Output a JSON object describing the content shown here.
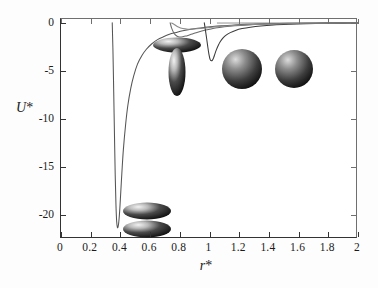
{
  "figure": {
    "background": "#ffffff",
    "frame_color": "#333333"
  },
  "axes": {
    "x": {
      "title": "r*",
      "title_main": "r",
      "title_star": "*",
      "min": 0,
      "max": 2,
      "ticks": [
        0,
        0.2,
        0.4,
        0.6,
        0.8,
        1,
        1.2,
        1.4,
        1.6,
        1.8,
        2
      ],
      "tick_labels": [
        "0",
        "0.2",
        "0.4",
        "0.6",
        "0.8",
        "1",
        "1.2",
        "1.4",
        "1.6",
        "1.8",
        "2"
      ]
    },
    "y": {
      "title": "U*",
      "title_main": "U",
      "title_star": "*",
      "min": -22.5,
      "max": 0.4,
      "ticks": [
        0,
        -5,
        -10,
        -15,
        -20
      ],
      "tick_labels": [
        "0",
        "-5",
        "-10",
        "-15",
        "-20"
      ]
    }
  },
  "chart_data": {
    "type": "line",
    "title": "",
    "xlabel": "r*",
    "ylabel": "U*",
    "xlim": [
      0,
      2
    ],
    "ylim": [
      -22.5,
      0.4
    ],
    "grid": false,
    "legend": "none",
    "annotations": [
      {
        "name": "side-by-side-ellipsoids",
        "x": 0.57,
        "y": -20.3,
        "config": "two parallel ellipsoids stacked side by side"
      },
      {
        "name": "end-to-end-offset-ellipsoids",
        "x": 0.8,
        "y": -2.6,
        "config": "horizontal ellipsoid above vertical ellipsoid (T shape)"
      },
      {
        "name": "two-spheres",
        "x": 1.22,
        "y": -5.0,
        "config": "two spheres side by side"
      }
    ],
    "series": [
      {
        "name": "side-by-side (deep well)",
        "style": "solid",
        "color": "#555555",
        "x": [
          0.345,
          0.35,
          0.355,
          0.36,
          0.365,
          0.37,
          0.375,
          0.38,
          0.385,
          0.39,
          0.395,
          0.4,
          0.41,
          0.42,
          0.435,
          0.45,
          0.47,
          0.49,
          0.515,
          0.545,
          0.575,
          0.61,
          0.65,
          0.69,
          0.73,
          0.775,
          0.82,
          0.87,
          0.92,
          0.97,
          1.02,
          1.08,
          1.15,
          1.25,
          1.4,
          1.6,
          1.8,
          2.0
        ],
        "y": [
          0.0,
          -3.0,
          -7.2,
          -11.6,
          -15.8,
          -18.9,
          -20.7,
          -21.3,
          -21.2,
          -20.6,
          -19.6,
          -18.3,
          -15.6,
          -13.2,
          -10.6,
          -8.6,
          -6.8,
          -5.5,
          -4.3,
          -3.4,
          -2.75,
          -2.2,
          -1.75,
          -1.45,
          -1.2,
          -1.0,
          -0.82,
          -0.68,
          -0.56,
          -0.47,
          -0.39,
          -0.31,
          -0.24,
          -0.16,
          -0.09,
          -0.04,
          -0.02,
          -0.01
        ]
      },
      {
        "name": "T-configuration (shallow)",
        "style": "solid",
        "color": "#6a6a6a",
        "x": [
          0.735,
          0.745,
          0.76,
          0.775,
          0.79,
          0.805,
          0.82,
          0.84,
          0.86,
          0.885,
          0.91,
          0.94,
          0.975,
          1.01,
          1.05,
          1.1,
          1.17,
          1.26,
          1.38,
          1.52,
          1.7,
          1.9,
          2.0
        ],
        "y": [
          0.0,
          -0.55,
          -1.05,
          -1.32,
          -1.45,
          -1.48,
          -1.45,
          -1.38,
          -1.28,
          -1.15,
          -1.02,
          -0.89,
          -0.75,
          -0.63,
          -0.52,
          -0.41,
          -0.3,
          -0.21,
          -0.13,
          -0.08,
          -0.04,
          -0.02,
          -0.01
        ]
      },
      {
        "name": "cross-configuration (narrow well near r*=1)",
        "style": "solid",
        "color": "#3a3a3a",
        "x": [
          0.965,
          0.972,
          0.98,
          0.988,
          0.996,
          1.004,
          1.012,
          1.02,
          1.028,
          1.036,
          1.046,
          1.058,
          1.072,
          1.09,
          1.112,
          1.14,
          1.175,
          1.22,
          1.275,
          1.345,
          1.43,
          1.53,
          1.65,
          1.78,
          1.9,
          2.0
        ],
        "y": [
          0.0,
          -0.7,
          -1.55,
          -2.45,
          -3.25,
          -3.8,
          -3.95,
          -3.88,
          -3.62,
          -3.25,
          -2.82,
          -2.38,
          -1.97,
          -1.6,
          -1.28,
          -1.02,
          -0.79,
          -0.6,
          -0.45,
          -0.32,
          -0.22,
          -0.15,
          -0.09,
          -0.05,
          -0.03,
          -0.02
        ]
      },
      {
        "name": "upper tail branch",
        "style": "solid",
        "color": "#8a8a8a",
        "x": [
          0.745,
          0.765,
          0.79,
          0.82,
          0.855,
          0.895,
          0.94,
          0.99,
          1.045,
          1.11,
          1.19,
          1.29,
          1.41,
          1.56,
          1.74,
          1.9,
          2.0
        ],
        "y": [
          -0.02,
          -0.2,
          -0.44,
          -0.6,
          -0.66,
          -0.64,
          -0.58,
          -0.5,
          -0.41,
          -0.33,
          -0.25,
          -0.18,
          -0.12,
          -0.07,
          -0.04,
          -0.02,
          -0.01
        ]
      }
    ]
  }
}
